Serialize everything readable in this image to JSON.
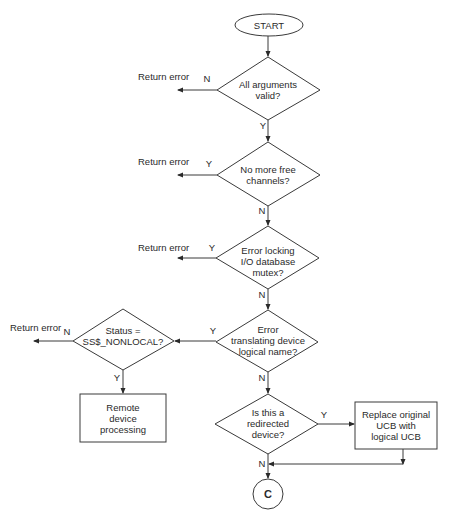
{
  "diagram": {
    "type": "flowchart",
    "start": {
      "label": "START"
    },
    "decisions": [
      {
        "id": "d1",
        "lines": [
          "All arguments",
          "valid?"
        ],
        "no_label": "N",
        "yes_label": "Y",
        "side_action": "Return error"
      },
      {
        "id": "d2",
        "lines": [
          "No more free",
          "channels?"
        ],
        "no_label": "N",
        "yes_label": "Y",
        "side_action": "Return error"
      },
      {
        "id": "d3",
        "lines": [
          "Error locking",
          "I/O database",
          "mutex?"
        ],
        "no_label": "N",
        "yes_label": "Y",
        "side_action": "Return error"
      },
      {
        "id": "d4",
        "lines": [
          "Error",
          "translating device",
          "logical name?"
        ],
        "no_label": "N",
        "yes_label": "Y"
      },
      {
        "id": "d5",
        "lines": [
          "Status =",
          "SS$_NONLOCAL?"
        ],
        "no_label": "N",
        "yes_label": "Y",
        "side_action": "Return error"
      },
      {
        "id": "d6",
        "lines": [
          "Is this a",
          "redirected",
          "device?"
        ],
        "no_label": "N",
        "yes_label": "Y"
      }
    ],
    "processes": [
      {
        "id": "p1",
        "lines": [
          "Remote",
          "device",
          "processing"
        ]
      },
      {
        "id": "p2",
        "lines": [
          "Replace original",
          "UCB with",
          "logical UCB"
        ]
      }
    ],
    "connector": {
      "label": "C"
    },
    "colors": {
      "stroke": "#3a3a3a",
      "text": "#2a2a2a",
      "background": "#ffffff"
    }
  }
}
